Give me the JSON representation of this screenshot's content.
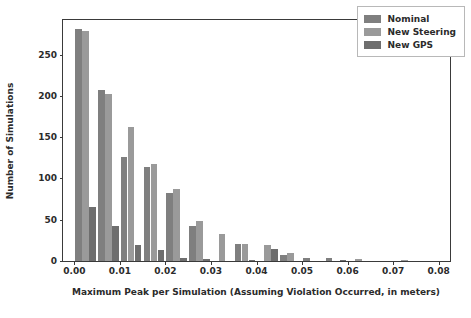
{
  "chart_data": {
    "type": "bar",
    "title": "",
    "subtitle": "",
    "xlabel": "Maximum Peak per Simulation (Assuming Violation Occurred, in meters)",
    "ylabel": "Number of Simulations",
    "xlim": [
      -0.0025,
      0.0825
    ],
    "ylim": [
      0,
      292
    ],
    "grid": false,
    "legend_position": "upper right",
    "x_tick_labels": [
      "0.00",
      "0.01",
      "0.02",
      "0.03",
      "0.04",
      "0.05",
      "0.06",
      "0.07",
      "0.08"
    ],
    "x_tick_values": [
      0.0,
      0.01,
      0.02,
      0.03,
      0.04,
      0.05,
      0.06,
      0.07,
      0.08
    ],
    "y_tick_labels": [
      "0",
      "50",
      "100",
      "150",
      "200",
      "250"
    ],
    "y_tick_values": [
      0,
      50,
      100,
      150,
      200,
      250
    ],
    "bin_centers": [
      0.0025,
      0.0075,
      0.0125,
      0.0175,
      0.0225,
      0.0275,
      0.0325,
      0.0375,
      0.0425,
      0.0475,
      0.0525,
      0.0575,
      0.0625,
      0.0675,
      0.0725,
      0.0775
    ],
    "bin_width": 0.005,
    "series": [
      {
        "name": "Nominal",
        "color": "#7f7f7f",
        "values": [
          281,
          207,
          126,
          114,
          83,
          42,
          0,
          21,
          0,
          7,
          4,
          4,
          0,
          0,
          0,
          0
        ]
      },
      {
        "name": "New Steering",
        "color": "#9a9a9a",
        "values": [
          279,
          202,
          162,
          118,
          87,
          49,
          33,
          21,
          19,
          10,
          0,
          0,
          2,
          0,
          1,
          0
        ]
      },
      {
        "name": "New GPS",
        "color": "#6e6e6e",
        "values": [
          65,
          42,
          19,
          13,
          4,
          2,
          0,
          1,
          14,
          0,
          0,
          1,
          0,
          0,
          0,
          0
        ]
      }
    ]
  },
  "legend": {
    "entries": [
      {
        "label": "Nominal"
      },
      {
        "label": "New Steering"
      },
      {
        "label": "New GPS"
      }
    ]
  }
}
